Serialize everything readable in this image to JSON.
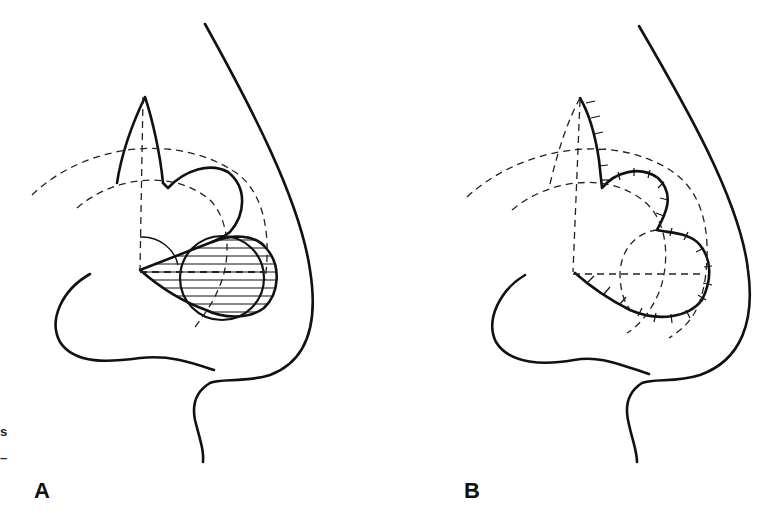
{
  "figure": {
    "panels": [
      {
        "id": "A",
        "label": "A",
        "description": "Design: circular defect (hatched) with two lobes and pivot arcs"
      },
      {
        "id": "B",
        "label": "B",
        "description": "Flaps transposed and sutured"
      }
    ],
    "margin_marks": [
      "s",
      "–"
    ],
    "colors": {
      "ink": "#111111",
      "background": "#ffffff"
    }
  }
}
